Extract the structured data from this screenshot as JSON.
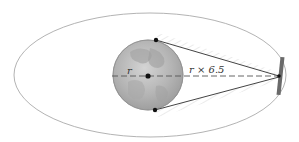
{
  "diagram": {
    "title": "",
    "labels": {
      "radius": "r",
      "distance": "r × 6.5"
    },
    "elements": {
      "orbit": "elliptical orbit",
      "planet": "globe",
      "satellite": "satellite",
      "tangent_points": 2
    },
    "colors": {
      "orbit": "#9a9a9a",
      "planet_fill": "#b8b8b8",
      "line": "#444444",
      "satellite": "#6a6a6a",
      "hatch": "#cfcfcf"
    }
  }
}
